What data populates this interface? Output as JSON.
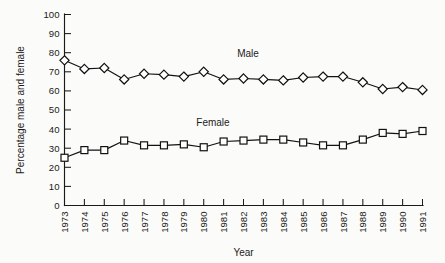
{
  "chart_data": {
    "type": "line",
    "title": "",
    "xlabel": "Year",
    "ylabel": "Percentage male and female",
    "x": [
      1973,
      1974,
      1975,
      1976,
      1977,
      1978,
      1979,
      1980,
      1981,
      1982,
      1983,
      1984,
      1985,
      1986,
      1987,
      1988,
      1989,
      1990,
      1991
    ],
    "categories": [
      "1973",
      "1974",
      "1975",
      "1976",
      "1977",
      "1978",
      "1979",
      "1980",
      "1981",
      "1982",
      "1983",
      "1984",
      "1985",
      "1986",
      "1987",
      "1988",
      "1989",
      "1990",
      "1991"
    ],
    "series": [
      {
        "name": "Male",
        "marker": "diamond",
        "values": [
          76,
          71.5,
          72,
          66,
          69,
          68.5,
          67.5,
          70,
          66,
          66.5,
          66,
          65.5,
          67,
          67.5,
          67.5,
          64.5,
          61,
          62,
          60.5
        ]
      },
      {
        "name": "Female",
        "marker": "square",
        "values": [
          25,
          29,
          29,
          34,
          31.5,
          31.5,
          32,
          30.5,
          33.5,
          34,
          34.5,
          34.5,
          33,
          31.5,
          31.5,
          34.5,
          38,
          37.5,
          39
        ]
      }
    ],
    "ylim": [
      0,
      100
    ],
    "ytick_step": 10,
    "yticks": [
      "0",
      "10",
      "20",
      "30",
      "40",
      "50",
      "60",
      "70",
      "80",
      "90",
      "100"
    ],
    "grid": false,
    "legend_position": "inline-annotations",
    "annotations": [
      {
        "text": "Male",
        "series": "Male"
      },
      {
        "text": "Female",
        "series": "Female"
      }
    ],
    "colors": {
      "ink": "#121212",
      "marker_fill": "#ffffff",
      "background": "#fbfbf9"
    }
  }
}
